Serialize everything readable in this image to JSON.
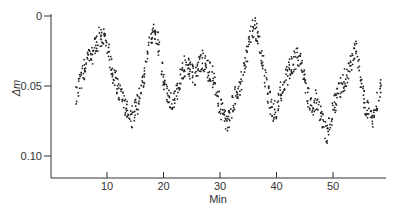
{
  "chart_data": {
    "type": "scatter",
    "title": "",
    "xlabel": "Min",
    "ylabel": "Δm",
    "xlim": [
      0,
      59
    ],
    "ylim": [
      0.115,
      0.0
    ],
    "y_inverted": true,
    "grid": false,
    "legend": null,
    "x_ticks": [
      10,
      20,
      30,
      40,
      50
    ],
    "y_ticks": [
      0,
      0.05,
      0.1
    ],
    "y_tick_labels": [
      "0",
      "0.05",
      "0.10"
    ],
    "x_tick_labels": [
      "10",
      "20",
      "30",
      "40",
      "50"
    ],
    "series": [
      {
        "name": "Δm",
        "note": "approximate trend of dense scatter (minutes, Δm)",
        "x": [
          4.5,
          5,
          5.5,
          6,
          6.5,
          7,
          7.5,
          8,
          8.5,
          9,
          9.5,
          10,
          10.5,
          11,
          11.5,
          12,
          12.5,
          13,
          13.5,
          14,
          14.5,
          15,
          15.5,
          16,
          16.5,
          17,
          17.5,
          18,
          18.5,
          19,
          19.5,
          20,
          20.5,
          21,
          21.5,
          22,
          22.5,
          23,
          23.5,
          24,
          24.5,
          25,
          25.5,
          26,
          26.5,
          27,
          27.5,
          28,
          28.5,
          29,
          29.5,
          30,
          30.5,
          31,
          31.5,
          32,
          32.5,
          33,
          33.5,
          34,
          34.5,
          35,
          35.5,
          36,
          36.5,
          37,
          37.5,
          38,
          38.5,
          39,
          39.5,
          40,
          40.5,
          41,
          41.5,
          42,
          42.5,
          43,
          43.5,
          44,
          44.5,
          45,
          45.5,
          46,
          46.5,
          47,
          47.5,
          48,
          48.5,
          49,
          49.5,
          50,
          50.5,
          51,
          51.5,
          52,
          52.5,
          53,
          53.5,
          54,
          54.5,
          55,
          55.5,
          56,
          56.5,
          57,
          57.5,
          58,
          58.5
        ],
        "y": [
          0.058,
          0.052,
          0.044,
          0.038,
          0.032,
          0.03,
          0.026,
          0.022,
          0.016,
          0.014,
          0.018,
          0.022,
          0.03,
          0.04,
          0.046,
          0.052,
          0.058,
          0.064,
          0.068,
          0.07,
          0.072,
          0.066,
          0.062,
          0.054,
          0.044,
          0.032,
          0.022,
          0.014,
          0.012,
          0.018,
          0.03,
          0.044,
          0.054,
          0.058,
          0.06,
          0.058,
          0.052,
          0.044,
          0.038,
          0.034,
          0.036,
          0.042,
          0.044,
          0.04,
          0.034,
          0.032,
          0.036,
          0.04,
          0.042,
          0.046,
          0.056,
          0.064,
          0.07,
          0.076,
          0.074,
          0.066,
          0.06,
          0.056,
          0.05,
          0.042,
          0.034,
          0.024,
          0.014,
          0.008,
          0.01,
          0.018,
          0.03,
          0.044,
          0.056,
          0.064,
          0.068,
          0.066,
          0.058,
          0.05,
          0.046,
          0.042,
          0.036,
          0.032,
          0.03,
          0.032,
          0.036,
          0.044,
          0.056,
          0.066,
          0.064,
          0.06,
          0.066,
          0.074,
          0.08,
          0.084,
          0.078,
          0.068,
          0.06,
          0.054,
          0.048,
          0.046,
          0.042,
          0.036,
          0.028,
          0.022,
          0.034,
          0.05,
          0.06,
          0.066,
          0.072,
          0.074,
          0.068,
          0.058,
          0.05
        ]
      }
    ]
  },
  "axes": {
    "xlabel": "Min",
    "ylabel": "Δm"
  }
}
